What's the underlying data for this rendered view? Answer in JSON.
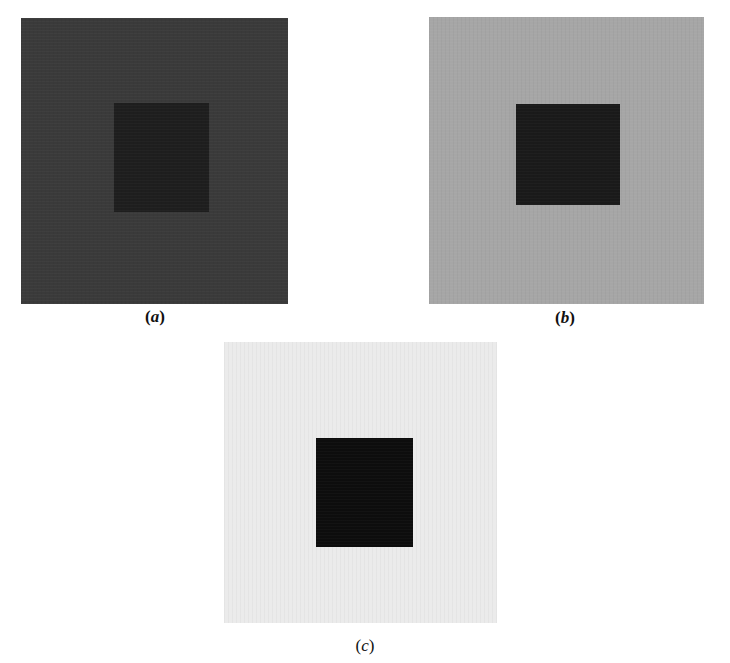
{
  "figure": {
    "panels": [
      {
        "id": "a",
        "caption_open": "(",
        "caption_letter": "a",
        "caption_close": ")",
        "background_color": "#3a3a3a",
        "square_color": "#1e1e1e"
      },
      {
        "id": "b",
        "caption_open": "(",
        "caption_letter": "b",
        "caption_close": ")",
        "background_color": "#a6a6a6",
        "square_color": "#1a1a1a"
      },
      {
        "id": "c",
        "caption_open": "(",
        "caption_letter": "c",
        "caption_close": ")",
        "background_color": "#ebebeb",
        "square_color": "#0d0d0d"
      }
    ]
  }
}
